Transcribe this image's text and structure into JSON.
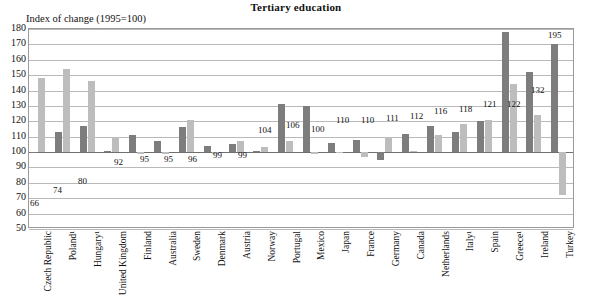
{
  "chart_data": {
    "type": "bar",
    "title": "Tertiary education",
    "ylabel": "Index of change (1995=100)",
    "xlabel": "",
    "ylim": [
      50,
      180
    ],
    "yticks": [
      180,
      170,
      160,
      150,
      140,
      130,
      120,
      110,
      100,
      90,
      80,
      70,
      60,
      50
    ],
    "grid": true,
    "legend": "none",
    "baseline": 100,
    "categories": [
      "Czech Republic",
      "Poland¹",
      "Hungary¹",
      "United Kingdom",
      "Finland",
      "Australia",
      "Sweden",
      "Denmark",
      "Austria",
      "Norway",
      "Portugal",
      "Mexico",
      "Japan",
      "France",
      "Germany",
      "Canada",
      "Netherlands",
      "Italy¹",
      "Spain",
      "Greece¹",
      "Ireland",
      "Turkey"
    ],
    "series": [
      {
        "name": "series-dark",
        "values": [
          100,
          113,
          117,
          101,
          111,
          107,
          116,
          104,
          105,
          101,
          131,
          130,
          106,
          108,
          95,
          112,
          117,
          113,
          120,
          178,
          152,
          170
        ]
      },
      {
        "name": "series-light",
        "values": [
          148,
          154,
          146,
          110,
          99,
          99,
          121,
          99,
          107,
          103,
          107,
          99,
          100,
          97,
          110,
          101,
          111,
          118,
          121,
          144,
          124,
          72
        ]
      }
    ],
    "data_labels": [
      {
        "category": "Czech Republic",
        "text": "66",
        "x": 30,
        "y": 199
      },
      {
        "category": "Poland¹",
        "text": "74",
        "x": 53,
        "y": 186
      },
      {
        "category": "Hungary¹",
        "text": "80",
        "x": 78,
        "y": 177
      },
      {
        "category": "United Kingdom",
        "text": "92",
        "x": 114,
        "y": 158
      },
      {
        "category": "Finland",
        "text": "95",
        "x": 140,
        "y": 155
      },
      {
        "category": "Australia",
        "text": "95",
        "x": 164,
        "y": 155
      },
      {
        "category": "Sweden",
        "text": "96",
        "x": 188,
        "y": 155
      },
      {
        "category": "Denmark",
        "text": "99",
        "x": 213,
        "y": 151
      },
      {
        "category": "Austria",
        "text": "99",
        "x": 238,
        "y": 151
      },
      {
        "category": "Norway",
        "text": "104",
        "x": 258,
        "y": 126
      },
      {
        "category": "Portugal",
        "text": "106",
        "x": 286,
        "y": 121
      },
      {
        "category": "Mexico",
        "text": "100",
        "x": 311,
        "y": 125
      },
      {
        "category": "Japan",
        "text": "110",
        "x": 336,
        "y": 116
      },
      {
        "category": "France",
        "text": "110",
        "x": 361,
        "y": 116
      },
      {
        "category": "Germany",
        "text": "111",
        "x": 386,
        "y": 114
      },
      {
        "category": "Canada",
        "text": "112",
        "x": 410,
        "y": 112
      },
      {
        "category": "Netherlands",
        "text": "116",
        "x": 434,
        "y": 107
      },
      {
        "category": "Italy¹",
        "text": "118",
        "x": 459,
        "y": 105
      },
      {
        "category": "Spain",
        "text": "121",
        "x": 483,
        "y": 100
      },
      {
        "category": "Greece¹",
        "text": "122",
        "x": 507,
        "y": 100
      },
      {
        "category": "Ireland",
        "text": "132",
        "x": 531,
        "y": 86
      },
      {
        "category": "Turkey",
        "text": "195",
        "x": 548,
        "y": 31
      }
    ],
    "colors": {
      "bar_dark": "#7d7d7d",
      "bar_light": "#bdbdbd",
      "gridline": "#b9b9b9",
      "baseline": "#6f6f6f",
      "frame": "#9a9a9a",
      "text": "#111111",
      "background": "#ffffff"
    }
  }
}
